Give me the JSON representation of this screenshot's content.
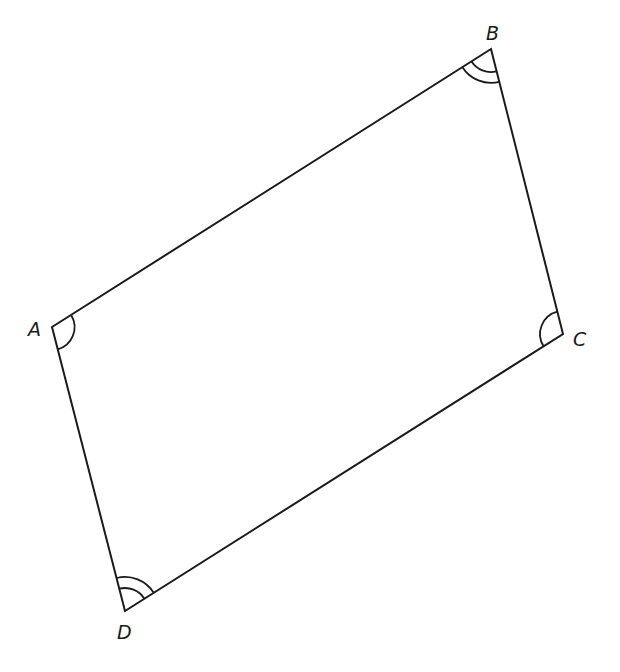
{
  "diagram": {
    "type": "parallelogram",
    "stroke_color": "#1a1a1a",
    "background": "#ffffff",
    "vertices": [
      {
        "name": "A",
        "x": 52,
        "y": 327,
        "label_x": 28,
        "label_y": 336,
        "angle_marks": 1
      },
      {
        "name": "B",
        "x": 491,
        "y": 49,
        "label_x": 486,
        "label_y": 40,
        "angle_marks": 2
      },
      {
        "name": "C",
        "x": 563,
        "y": 334,
        "label_x": 573,
        "label_y": 346,
        "angle_marks": 1
      },
      {
        "name": "D",
        "x": 125,
        "y": 611,
        "label_x": 117,
        "label_y": 639,
        "angle_marks": 2
      }
    ],
    "edges": [
      [
        "A",
        "B"
      ],
      [
        "B",
        "C"
      ],
      [
        "C",
        "D"
      ],
      [
        "D",
        "A"
      ]
    ],
    "labels": {
      "A": "A",
      "B": "B",
      "C": "C",
      "D": "D"
    }
  }
}
